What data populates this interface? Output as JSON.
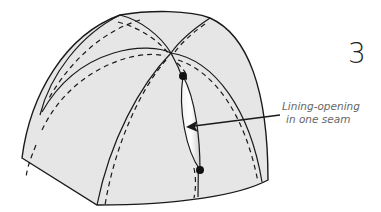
{
  "figure": {
    "step_number": "3",
    "annotation": {
      "line1": "Lining-opening",
      "line2": "in one seam"
    },
    "colors": {
      "fill": "#e6e6e6",
      "stroke": "#1a1a1a",
      "text": "#666666",
      "opening_light": "#ffffff"
    },
    "elements": [
      "dome",
      "seams",
      "stitch-lines",
      "lining-opening",
      "end-dots",
      "leader-arrow"
    ]
  }
}
